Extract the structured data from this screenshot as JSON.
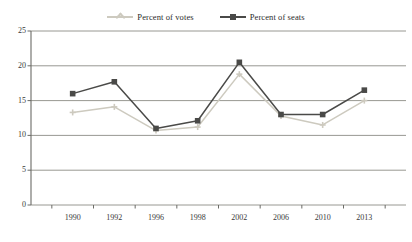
{
  "chart_data": {
    "type": "line",
    "title": "",
    "subtitle": "",
    "xlabel": "",
    "ylabel": "",
    "categories": [
      "1990",
      "1992",
      "1996",
      "1998",
      "2002",
      "2006",
      "2010",
      "2013"
    ],
    "ylim": [
      0,
      25
    ],
    "yticks": [
      0,
      5,
      10,
      15,
      20,
      25
    ],
    "ytick_labels": [
      "0",
      "5",
      "10",
      "15",
      "20",
      "25"
    ],
    "grid": true,
    "grid_axis": "y",
    "legend_position": "top-center",
    "series": [
      {
        "name": "Percent of votes",
        "color": "#cdcabf",
        "marker": "plus",
        "values": [
          13.3,
          14.1,
          10.7,
          11.2,
          18.8,
          12.8,
          11.5,
          15.0
        ]
      },
      {
        "name": "Percent of seats",
        "color": "#4a4a48",
        "marker": "square",
        "values": [
          16.0,
          17.7,
          11.0,
          12.1,
          20.5,
          13.0,
          13.0,
          16.5
        ]
      }
    ]
  },
  "colors": {
    "axis": "#6b6b66",
    "grid": "#8c8c86",
    "text": "#33332f",
    "background": "#ffffff",
    "series_votes": "#cdcabf",
    "series_seats": "#4a4a48"
  }
}
